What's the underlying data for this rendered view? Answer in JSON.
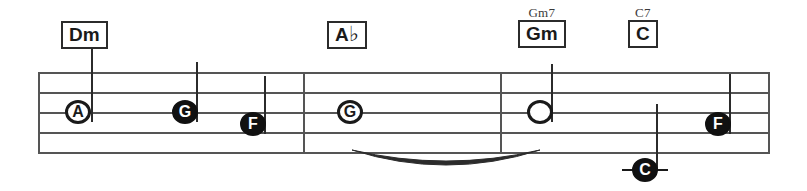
{
  "notation": {
    "type": "guitar-chord-melody-staff",
    "staff": {
      "left": 38,
      "right": 770,
      "top": 72,
      "line_spacing": 20,
      "line_count": 5,
      "color": "#555555"
    },
    "barlines": [
      {
        "name": "barline-1",
        "x": 303
      },
      {
        "name": "barline-2",
        "x": 500
      },
      {
        "name": "barline-end",
        "x": 768
      }
    ],
    "chords": [
      {
        "id": "chord-dm",
        "label": "Dm",
        "superscript": "",
        "accidental": "",
        "x": 61,
        "y": 20
      },
      {
        "id": "chord-ab",
        "label": "A",
        "superscript": "",
        "accidental": "♭",
        "x": 327,
        "y": 20
      },
      {
        "id": "chord-gm",
        "label": "Gm",
        "superscript": "Gm7",
        "accidental": "",
        "x": 518,
        "y": 6
      },
      {
        "id": "chord-c",
        "label": "C",
        "superscript": "C7",
        "accidental": "",
        "x": 628,
        "y": 6
      }
    ],
    "notes": [
      {
        "id": "note-a",
        "letter": "A",
        "head": "open",
        "x": 65,
        "y": 110,
        "stem": {
          "x": 91,
          "top": 48,
          "bottom": 122
        },
        "ledger": null
      },
      {
        "id": "note-g1",
        "letter": "G",
        "head": "filled",
        "x": 172,
        "y": 110,
        "stem": {
          "x": 196,
          "top": 62,
          "bottom": 122
        },
        "ledger": null
      },
      {
        "id": "note-f1",
        "letter": "F",
        "head": "filled",
        "x": 240,
        "y": 122,
        "stem": {
          "x": 264,
          "top": 76,
          "bottom": 134
        },
        "ledger": null
      },
      {
        "id": "note-g2",
        "letter": "G",
        "head": "open",
        "x": 337,
        "y": 110,
        "stem": null,
        "ledger": null
      },
      {
        "id": "note-open-whole",
        "letter": "",
        "head": "open",
        "x": 527,
        "y": 110,
        "stem": {
          "x": 551,
          "top": 64,
          "bottom": 122
        },
        "ledger": null
      },
      {
        "id": "note-c-low",
        "letter": "C",
        "head": "filled",
        "x": 632,
        "y": 158,
        "stem": {
          "x": 656,
          "top": 104,
          "bottom": 170
        },
        "ledger": {
          "x": 622,
          "y": 169,
          "width": 46
        }
      },
      {
        "id": "note-f2",
        "letter": "F",
        "head": "filled",
        "x": 705,
        "y": 122,
        "stem": {
          "x": 729,
          "top": 74,
          "bottom": 134
        },
        "ledger": null
      }
    ],
    "slur": {
      "id": "slur-g2-to-whole",
      "from_note": "note-g2",
      "to_note": "note-open-whole",
      "start_x": 352,
      "start_y": 148,
      "control_x": 446,
      "control_y": 176,
      "end_x": 540,
      "end_y": 148
    }
  }
}
